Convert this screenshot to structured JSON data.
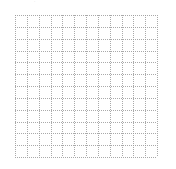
{
  "diagram": {
    "type": "grid",
    "style": "dotted",
    "rows": 12,
    "cols": 12,
    "origin": [
      15,
      15
    ],
    "size": [
      142,
      142
    ],
    "line_color": "#9a9a9a",
    "background": "#ffffff"
  },
  "top_mark": {
    "glyph": "·"
  }
}
